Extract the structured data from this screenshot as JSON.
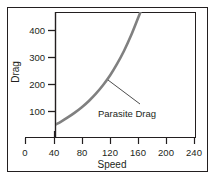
{
  "chart_data": {
    "type": "line",
    "title": "",
    "xlabel": "Speed",
    "ylabel": "Drag",
    "xlim": [
      0,
      260
    ],
    "ylim": [
      0,
      470
    ],
    "xticks": [
      0,
      40,
      80,
      120,
      160,
      200,
      240
    ],
    "xtick_labels": [
      "0",
      "40",
      "80",
      "120",
      "160",
      "200",
      "240"
    ],
    "yticks": [
      100,
      200,
      300,
      400
    ],
    "ytick_labels": [
      "100",
      "200",
      "300",
      "400"
    ],
    "grid": false,
    "legend": "none",
    "annotations": [
      {
        "text": "Parasite Drag",
        "points_to_x": 108,
        "points_to_y": 215
      }
    ],
    "series": [
      {
        "name": "Parasite Drag",
        "color": "#808080",
        "x": [
          22,
          30,
          40,
          50,
          60,
          70,
          80,
          90,
          100,
          110,
          120,
          130,
          140,
          150,
          160,
          168
        ],
        "y": [
          22,
          33,
          48,
          62,
          78,
          96,
          116,
          139,
          166,
          197,
          233,
          276,
          325,
          382,
          447,
          500
        ]
      }
    ]
  },
  "axes": {
    "x_tick_labels": [
      "0",
      "40",
      "80",
      "120",
      "160",
      "200",
      "240"
    ],
    "y_tick_labels": [
      "400",
      "300",
      "200",
      "100"
    ],
    "x_title": "Speed",
    "y_title": "Drag"
  },
  "annotation": {
    "label": "Parasite Drag"
  },
  "style": {
    "curve_color": "#808080",
    "axis_color": "#231f20",
    "border_color": "#231f20",
    "background": "#ffffff"
  }
}
